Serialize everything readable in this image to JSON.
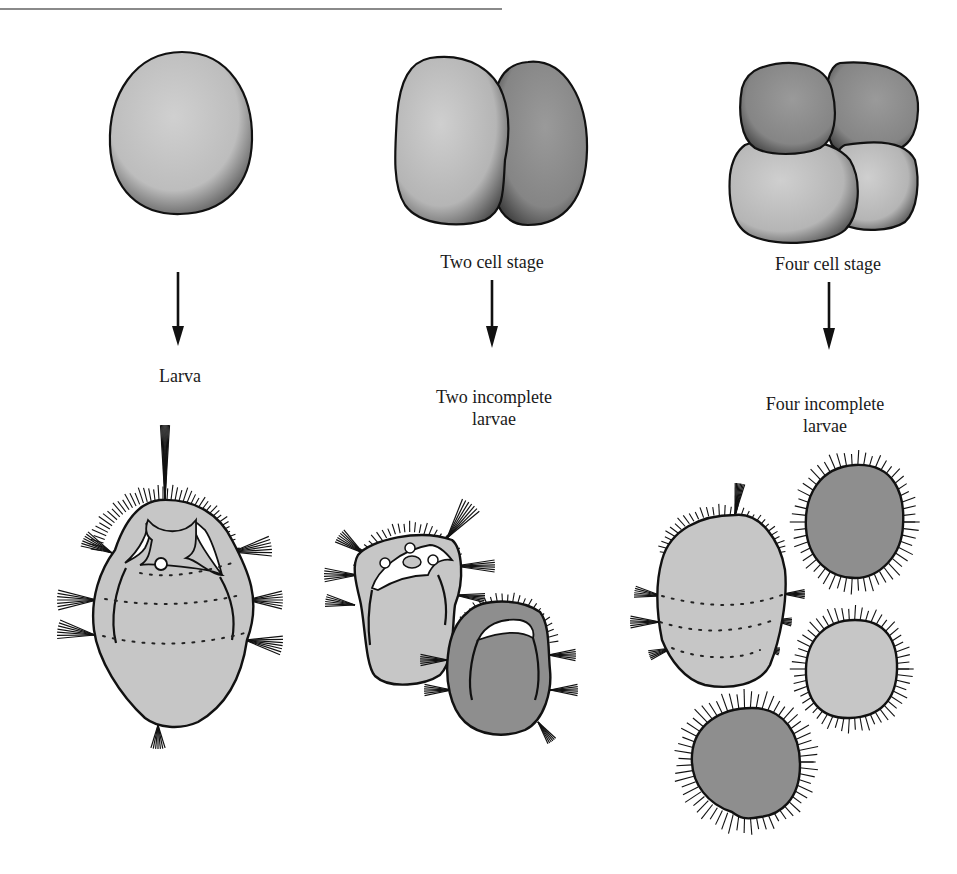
{
  "figure": {
    "stages": [
      {
        "id": "one-cell",
        "top_label": "",
        "bottom_label_lines": [
          "Larva"
        ]
      },
      {
        "id": "two-cell",
        "top_label": "Two cell stage",
        "bottom_label_lines": [
          "Two incomplete",
          "larvae"
        ]
      },
      {
        "id": "four-cell",
        "top_label": "Four cell stage",
        "bottom_label_lines": [
          "Four incomplete",
          "larvae"
        ]
      }
    ],
    "colors": {
      "light_fill": "#c6c6c6",
      "dark_fill": "#8e8e8e",
      "outline": "#111111",
      "top_rule": "#8a8a8a",
      "background": "#ffffff"
    }
  }
}
